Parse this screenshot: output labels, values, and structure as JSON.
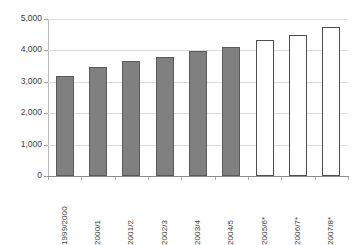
{
  "chart_data": {
    "type": "bar",
    "title": "",
    "subtitle": "",
    "xlabel": "",
    "ylabel": "",
    "ylim": [
      0,
      5000
    ],
    "grid": true,
    "legend": "none",
    "categories": [
      "1999/2000",
      "2000/1",
      "2001/2",
      "2002/3",
      "2003/4",
      "2004/5",
      "2005/6*",
      "2006/7*",
      "2007/8*"
    ],
    "values": [
      3200,
      3460,
      3650,
      3790,
      3970,
      4110,
      4340,
      4500,
      4760
    ],
    "series": [
      {
        "name": "Actual",
        "values": [
          3200,
          3460,
          3650,
          3790,
          3970,
          4110,
          null,
          null,
          null
        ]
      },
      {
        "name": "Forecast",
        "values": [
          null,
          null,
          null,
          null,
          null,
          null,
          4340,
          4500,
          4760
        ]
      }
    ],
    "bar_styles": [
      "actual",
      "actual",
      "actual",
      "actual",
      "actual",
      "actual",
      "forecast",
      "forecast",
      "forecast"
    ],
    "y_ticks": [
      0,
      1000,
      2000,
      3000,
      4000,
      5000
    ],
    "y_tick_labels": [
      "0",
      "1,000",
      "2,000",
      "3,000",
      "4,000",
      "5,000"
    ],
    "colors": {
      "actual_fill": "#808080",
      "actual_border": "#5a5a5a",
      "forecast_fill": "#ffffff",
      "forecast_border": "#4d4d4d",
      "gridline": "#dcdcdc",
      "axis": "#8c8c8c",
      "text": "#3b3b3b",
      "background": "#ffffff"
    }
  }
}
